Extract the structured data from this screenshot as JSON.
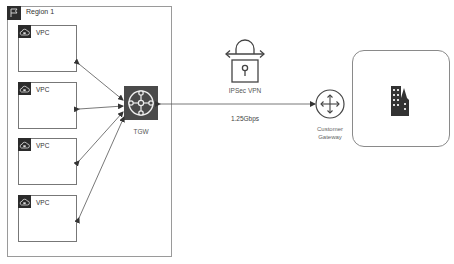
{
  "region": {
    "label": "Region 1",
    "icon": "flag-icon"
  },
  "vpcs": [
    {
      "label": "VPC",
      "icon": "cloud-lock-icon"
    },
    {
      "label": "VPC",
      "icon": "cloud-lock-icon"
    },
    {
      "label": "VPC",
      "icon": "cloud-lock-icon"
    },
    {
      "label": "VPC",
      "icon": "cloud-lock-icon"
    }
  ],
  "tgw": {
    "label": "TGW",
    "icon": "transit-gateway-icon"
  },
  "vpn": {
    "label": "IPSec VPN",
    "icon": "vpn-lock-icon",
    "bandwidth": "1.25Gbps"
  },
  "customer_gateway": {
    "label_line1": "Customer",
    "label_line2": "Gateway",
    "icon": "router-icon"
  },
  "corporate": {
    "icon": "building-icon"
  },
  "colors": {
    "icon_dark": "#2d2d2d",
    "tgw_fill": "#4a4a4a",
    "line": "#555555",
    "border": "#8a8a8a"
  }
}
